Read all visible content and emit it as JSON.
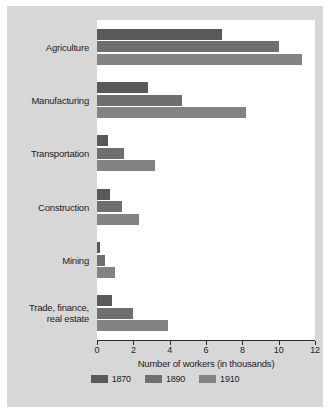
{
  "chart_data": {
    "type": "bar",
    "orientation": "horizontal",
    "title": "",
    "xlabel": "Number of workers (in thousands)",
    "ylabel": "",
    "xlim": [
      0,
      12
    ],
    "xticks": [
      0,
      2,
      4,
      6,
      8,
      10,
      12
    ],
    "xtick_labels": [
      "0",
      "2",
      "4",
      "6",
      "8",
      "10",
      "12"
    ],
    "grid": false,
    "legend_position": "bottom",
    "categories": [
      "Agriculture",
      "Manufacturing",
      "Transportation",
      "Construction",
      "Mining",
      "Trade, finance,\nreal estate"
    ],
    "series": [
      {
        "name": "1870",
        "color": "#595959",
        "values": [
          6.9,
          2.8,
          0.6,
          0.7,
          0.15,
          0.8
        ]
      },
      {
        "name": "1890",
        "color": "#6f6f6f",
        "values": [
          10.0,
          4.7,
          1.5,
          1.4,
          0.45,
          2.0
        ]
      },
      {
        "name": "1910",
        "color": "#838383",
        "values": [
          11.3,
          8.2,
          3.2,
          2.3,
          1.0,
          3.9
        ]
      }
    ]
  },
  "figure": {
    "background_color": "#d7d7d7",
    "panel_color": "#ffffff",
    "axis_color": "#2b2b2b",
    "text_color": "#1d1d1d"
  }
}
